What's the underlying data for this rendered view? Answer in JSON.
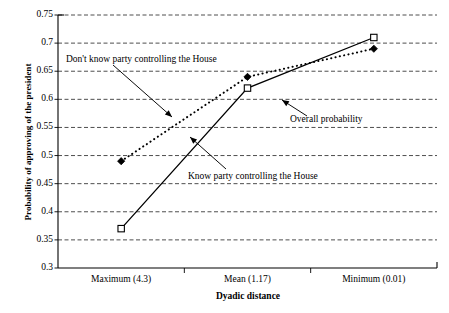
{
  "chart_data": {
    "type": "line",
    "title": "",
    "xlabel": "Dyadic distance",
    "ylabel": "Probability of approving of the president",
    "categories": [
      "Maximum (4.3)",
      "Mean (1.17)",
      "Minimum (0.01)"
    ],
    "series": [
      {
        "name": "Know party controlling the House",
        "marker": "open-square",
        "line_style": "solid",
        "values": [
          0.37,
          0.62,
          0.71
        ]
      },
      {
        "name": "Don't know party controlling the House",
        "marker": "filled-diamond",
        "line_style": "dotted",
        "values": [
          0.49,
          0.64,
          0.69
        ]
      }
    ],
    "ylim": [
      0.3,
      0.75
    ],
    "ytick_step": 0.05,
    "ytick_labels": [
      "0.75",
      "0.7",
      "0.65",
      "0.6",
      "0.55",
      "0.5",
      "0.45",
      "0.4",
      "0.35",
      "0.3"
    ],
    "ytick_values": [
      0.75,
      0.7,
      0.65,
      0.6,
      0.55,
      0.5,
      0.45,
      0.4,
      0.35,
      0.3
    ],
    "grid": "horizontal-dashed",
    "legend": "none",
    "annotations": [
      {
        "id": "dont-know",
        "text": "Don't know party controlling the House",
        "arrow_from": [
          113,
          65
        ],
        "arrow_to": [
          172,
          117
        ]
      },
      {
        "id": "overall",
        "text": "Overall probability",
        "arrow_from": [
          307,
          116
        ],
        "arrow_to": [
          282,
          100
        ]
      },
      {
        "id": "know",
        "text": "Know party controlling the House",
        "arrow_from": [
          226,
          169
        ],
        "arrow_to": [
          190,
          137
        ]
      }
    ]
  },
  "axes": {
    "x_title": "Dyadic distance",
    "y_title": "Probability of approving of the president"
  }
}
